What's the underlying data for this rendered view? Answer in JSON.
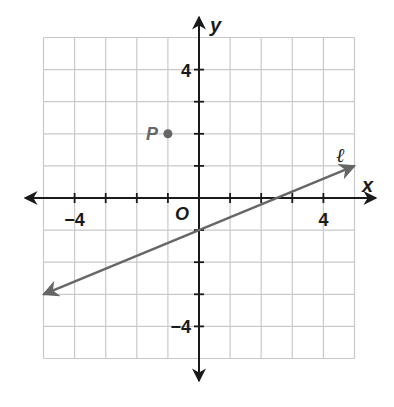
{
  "chart_data": {
    "type": "line",
    "title": "",
    "xlabel": "x",
    "ylabel": "y",
    "xlim": [
      -5,
      5
    ],
    "ylim": [
      -5,
      5
    ],
    "grid": true,
    "origin_label": "O",
    "x_tick_labels": [
      {
        "value": -4,
        "label": "−4"
      },
      {
        "value": 4,
        "label": "4"
      }
    ],
    "y_tick_labels": [
      {
        "value": 4,
        "label": "4"
      },
      {
        "value": -4,
        "label": "−4"
      }
    ],
    "series": [
      {
        "name": "ℓ",
        "kind": "line-with-arrows",
        "points": [
          [
            -5,
            -3
          ],
          [
            0,
            -1
          ],
          [
            2.5,
            0
          ],
          [
            5,
            1
          ]
        ],
        "slope": 0.4,
        "y_intercept": -1
      }
    ],
    "points": [
      {
        "label": "P",
        "x": -1,
        "y": 2
      }
    ]
  },
  "colors": {
    "axis": "#1a1a1a",
    "grid": "#c9c9c9",
    "line": "#666666",
    "point": "#666666"
  }
}
